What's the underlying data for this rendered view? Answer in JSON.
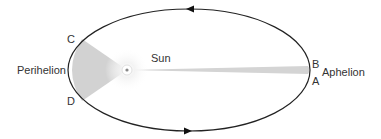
{
  "diagram": {
    "labels": {
      "sun": "Sun",
      "perihelion": "Perihelion",
      "aphelion": "Aphelion",
      "point_a": "A",
      "point_b": "B",
      "point_c": "C",
      "point_d": "D"
    },
    "colors": {
      "orbit": "#222222",
      "swept_area": "#d2d2d2",
      "text": "#333333"
    },
    "orbit_direction": "counterclockwise"
  }
}
